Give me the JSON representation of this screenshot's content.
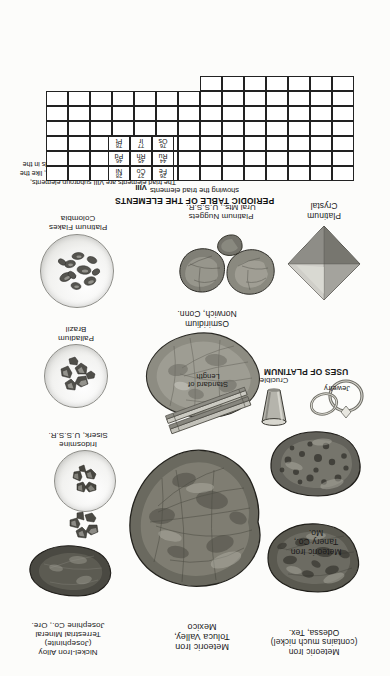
{
  "plate": {
    "orientation": "rotated-180",
    "background": "#fcfcfa"
  },
  "periodic_table": {
    "title": "PERIODIC TABLE OF THE ELEMENTS",
    "subtitle": "showing the triad elements",
    "group_label": "VIII",
    "note": "The triad elements are VIII subgroup elements, closing the three transition series, and are, like the noble gases, more stable than other metals in the same periods.",
    "elements": [
      {
        "number": "26",
        "symbol": "Fe",
        "col": 0,
        "row": 0
      },
      {
        "number": "27",
        "symbol": "Co",
        "col": 1,
        "row": 0
      },
      {
        "number": "28",
        "symbol": "Ni",
        "col": 2,
        "row": 0
      },
      {
        "number": "44",
        "symbol": "Ru",
        "col": 0,
        "row": 1
      },
      {
        "number": "45",
        "symbol": "Rh",
        "col": 1,
        "row": 1
      },
      {
        "number": "46",
        "symbol": "Pd",
        "col": 2,
        "row": 1
      },
      {
        "number": "76",
        "symbol": "Os",
        "col": 0,
        "row": 2
      },
      {
        "number": "77",
        "symbol": "Ir",
        "col": 1,
        "row": 2
      },
      {
        "number": "78",
        "symbol": "Pt",
        "col": 2,
        "row": 2
      }
    ]
  },
  "specimens": [
    {
      "id": "platinum-flakes",
      "lines": [
        "Platinum Flakes",
        "Colombia"
      ],
      "bold_lines": 1
    },
    {
      "id": "palladium",
      "lines": [
        "Palladium",
        "Brazil"
      ],
      "bold_lines": 1
    },
    {
      "id": "iridosmine",
      "lines": [
        "Iridosmine",
        "Siserk, U.S.S.R."
      ],
      "bold_lines": 1
    },
    {
      "id": "platinum-crystal",
      "lines": [
        "Platinum",
        "Crystal"
      ],
      "bold_lines": 2
    },
    {
      "id": "platinum-nuggets",
      "lines": [
        "Platinum Nuggets",
        "Ural Mts., U.S.S.R."
      ],
      "bold_lines": 1
    },
    {
      "id": "osmiridium",
      "lines": [
        "Osmiridium",
        "Norwich, Conn."
      ],
      "bold_lines": 1
    },
    {
      "id": "uses-of-platinum",
      "lines": [
        "USES OF PLATINUM"
      ],
      "bold_lines": 1,
      "sub_labels": [
        {
          "id": "jewelry",
          "text": "Jewelry"
        },
        {
          "id": "crucible",
          "text": "Crucible"
        },
        {
          "id": "standard-of-length",
          "text": "Standard of Length"
        }
      ]
    },
    {
      "id": "nickel-iron-alloy",
      "lines": [
        "Nickel-Iron Alloy",
        "(Josephinite)",
        "Terrestrial Mineral",
        "Josephine Co., Ore."
      ],
      "bold_lines": 1
    },
    {
      "id": "meteoric-iron-toluca",
      "lines": [
        "Meteoric Iron",
        "Toluca Valley,",
        "Mexico"
      ],
      "bold_lines": 1
    },
    {
      "id": "meteoric-iron-odessa",
      "lines": [
        "Meteoric Iron",
        "(contains much nickel)",
        "Odessa, Tex."
      ],
      "bold_lines": 1
    },
    {
      "id": "meteoric-iron-tanery",
      "lines": [
        "Meteoric Iron",
        "Tanery Co.,",
        "Mo."
      ],
      "bold_lines": 1
    }
  ]
}
